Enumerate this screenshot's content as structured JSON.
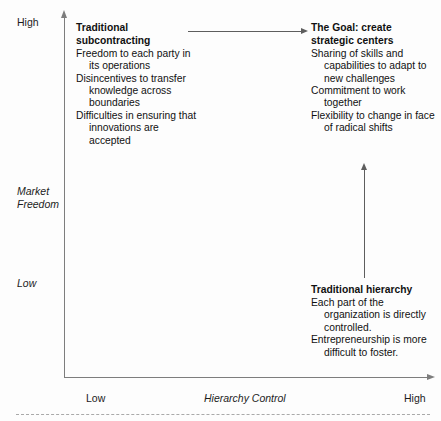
{
  "diagram": {
    "axes": {
      "y_axis": {
        "name": "Market Freedom",
        "label_lines": "Market\nFreedom",
        "high_label": "High",
        "low_label": "Low"
      },
      "x_axis": {
        "name": "Hierarchy Control",
        "label": "Hierarchy Control",
        "low_label": "Low",
        "high_label": "High"
      }
    },
    "header_remnant": "",
    "blocks": {
      "subcontracting": {
        "heading_line1": "Traditional",
        "heading_line2": "subcontracting",
        "items": [
          "Freedom to each party in its operations",
          "Disincentives to transfer knowledge across boundaries",
          "Difficulties in ensuring that innovations are accepted"
        ]
      },
      "goal": {
        "heading_line1": "The Goal: create",
        "heading_line2": "strategic centers",
        "items": [
          "Sharing of skills and capabilities to adapt to new challenges",
          "Commitment to work together",
          "Flexibility to change in face of radical shifts"
        ]
      },
      "hierarchy": {
        "heading_line1": "Traditional hierarchy",
        "heading_line2": "",
        "items": [
          "Each part of the organization is directly controlled.",
          "Entrepreneurship is more difficult to foster."
        ]
      }
    },
    "connectors": {
      "horizontal_arrow": "arrow-right-from-subcontracting-to-goal",
      "vertical_arrow": "arrow-up-from-hierarchy-to-goal"
    },
    "colors": {
      "axis": "#7d7d7d",
      "connector": "#5e5e5e",
      "text": "#111111",
      "background": "#fdfdfd"
    }
  }
}
